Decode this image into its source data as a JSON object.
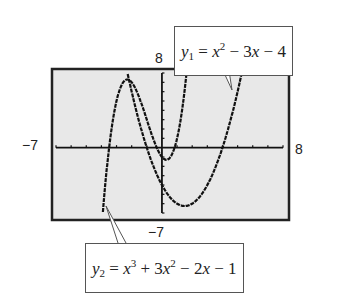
{
  "chart_data": {
    "type": "line",
    "title": "",
    "xlabel": "",
    "ylabel": "",
    "xlim": [
      -7,
      8
    ],
    "ylim": [
      -7,
      8
    ],
    "grid": false,
    "tick_labels": {
      "xmin": "−7",
      "xmax": "8",
      "ymin": "−7",
      "ymax": "8"
    },
    "series": [
      {
        "name": "y1",
        "expression": "y1 = x^2 - 3x - 4",
        "coefficients": [
          1,
          -3,
          -4
        ]
      },
      {
        "name": "y2",
        "expression": "y2 = x^3 + 3x^2 - 2x - 1",
        "coefficients": [
          1,
          3,
          -2,
          -1
        ]
      }
    ],
    "annotations": [
      {
        "text": "y1 = x² − 3x − 4",
        "position": "top-right callout"
      },
      {
        "text": "y2 = x³ + 3x² − 2x − 1",
        "position": "bottom callout"
      }
    ]
  },
  "labels": {
    "ymax": "8",
    "ymin": "−7",
    "xmin": "−7",
    "xmax": "8"
  },
  "callouts": {
    "y1": {
      "var": "y",
      "sub": "1",
      "eq": " = ",
      "x": "x",
      "pow": "2",
      "rest": " − 3",
      "x2": "x",
      "tail": " − 4"
    },
    "y2": {
      "var": "y",
      "sub": "2",
      "eq": " = ",
      "x": "x",
      "pow": "3",
      "rest": " + 3",
      "x2": "x",
      "pow2": "2",
      "mid": " − 2",
      "x3": "x",
      "tail": " − 1"
    }
  },
  "colors": {
    "screen_bg": "#e8e8e8",
    "frame": "#222222",
    "curve": "#111111"
  }
}
